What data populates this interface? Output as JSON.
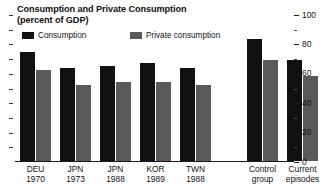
{
  "chart_data": {
    "type": "bar",
    "title": "Consumption and Private Consumption",
    "subtitle": "(percent of GDP)",
    "title_lines": [
      "Consumption and Private Consumption",
      "(percent of GDP)"
    ],
    "xlabel": "",
    "ylabel": "",
    "ylim": [
      0,
      100
    ],
    "yticks": [
      0,
      20,
      40,
      60,
      80,
      100
    ],
    "ytick_labels": [
      "0",
      "20",
      "40",
      "60",
      "80",
      "100"
    ],
    "minor_yticks": [
      10,
      30,
      50,
      70,
      90
    ],
    "grid": false,
    "legend_position": "top-left",
    "axis_side": "right",
    "categories": [
      {
        "line1": "DEU",
        "line2": "1970"
      },
      {
        "line1": "JPN",
        "line2": "1973"
      },
      {
        "line1": "JPN",
        "line2": "1988"
      },
      {
        "line1": "KOR",
        "line2": "1989"
      },
      {
        "line1": "TWN",
        "line2": "1988"
      },
      {
        "line1": "Control",
        "line2": "group"
      },
      {
        "line1": "Current",
        "line2": "episodes"
      }
    ],
    "series": [
      {
        "name": "Consumption",
        "color": "#111111",
        "values": [
          74,
          63,
          65,
          67,
          63,
          83,
          69
        ]
      },
      {
        "name": "Private consumption",
        "color": "#5a5a5a",
        "values": [
          62,
          52,
          54,
          54,
          52,
          69,
          58
        ]
      }
    ]
  },
  "legend": {
    "items": [
      {
        "label": "Consumption",
        "swatch": "black-swatch-icon"
      },
      {
        "label": "Private consumption",
        "swatch": "gray-swatch-icon"
      }
    ]
  }
}
